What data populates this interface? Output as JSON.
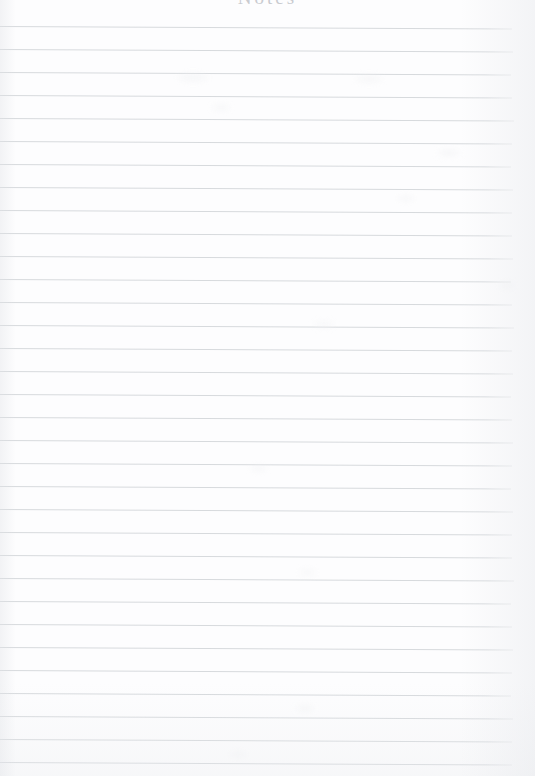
{
  "document": {
    "type": "lined-notepad-page",
    "orientation": "portrait",
    "width_px": 535,
    "height_px": 776,
    "background_color": "#fdfdfe",
    "is_blank": true,
    "written_content": ""
  },
  "header": {
    "text": "Notes",
    "color": "#c9cbd0",
    "alignment": "center",
    "cropped_at_top_edge": true
  },
  "ruling": {
    "line_color": "#d7dadd",
    "line_thickness_px": 1,
    "line_spacing_px": 23,
    "first_line_y_px": 26,
    "line_count": 33,
    "left_edge_x_px": 0,
    "right_edge_x_px": 512,
    "skew_degrees": 0.28,
    "positions_y": [
      26,
      49,
      72,
      95,
      118,
      141,
      164,
      187,
      210,
      233,
      256,
      279,
      302,
      325,
      348,
      371,
      394,
      417,
      440,
      463,
      486,
      509,
      532,
      555,
      578,
      601,
      624,
      647,
      670,
      693,
      716,
      739,
      762
    ],
    "line_widths": [
      512,
      513,
      511,
      512,
      514,
      512,
      511,
      513,
      512,
      512,
      513,
      511,
      512,
      514,
      512,
      513,
      511,
      512,
      513,
      512,
      511,
      513,
      512,
      512,
      514,
      511,
      512,
      513,
      512,
      511,
      513,
      512,
      512
    ]
  },
  "scan_artifacts": {
    "smudges": [
      {
        "x": 178,
        "y": 74,
        "w": 30,
        "h": 7
      },
      {
        "x": 356,
        "y": 76,
        "w": 26,
        "h": 6
      },
      {
        "x": 212,
        "y": 105,
        "w": 18,
        "h": 5
      },
      {
        "x": 438,
        "y": 150,
        "w": 22,
        "h": 6
      },
      {
        "x": 398,
        "y": 196,
        "w": 16,
        "h": 5
      },
      {
        "x": 500,
        "y": 283,
        "w": 14,
        "h": 5
      },
      {
        "x": 314,
        "y": 322,
        "w": 20,
        "h": 5
      },
      {
        "x": 250,
        "y": 466,
        "w": 17,
        "h": 5
      },
      {
        "x": 300,
        "y": 570,
        "w": 15,
        "h": 5
      },
      {
        "x": 296,
        "y": 706,
        "w": 18,
        "h": 5
      },
      {
        "x": 230,
        "y": 752,
        "w": 16,
        "h": 5
      }
    ]
  }
}
